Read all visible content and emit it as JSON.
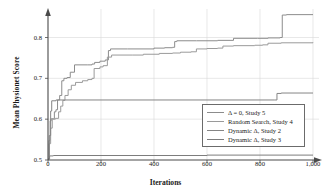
{
  "chart_data": {
    "type": "line",
    "title": "",
    "xlabel": "Iterations",
    "ylabel": "Mean Physionet Score",
    "xlim": [
      0,
      1000
    ],
    "ylim": [
      0.5,
      0.86
    ],
    "grid": true,
    "legend_position": "lower-right",
    "xticks": [
      0,
      200,
      400,
      600,
      800,
      1000
    ],
    "xtick_labels": [
      "0",
      "200",
      "400",
      "600",
      "800",
      "1,000"
    ],
    "yticks": [
      0.5,
      0.6,
      0.7,
      0.8
    ],
    "ytick_labels": [
      "0.5",
      "0.6",
      "0.7",
      "0.8"
    ],
    "series": [
      {
        "name": "Δ = 0, Study 5",
        "color": "#8c8c8c",
        "points": [
          [
            0,
            0.503
          ],
          [
            4,
            0.548
          ],
          [
            8,
            0.596
          ],
          [
            12,
            0.601
          ],
          [
            20,
            0.601
          ],
          [
            24,
            0.618
          ],
          [
            30,
            0.623
          ],
          [
            36,
            0.647
          ],
          [
            44,
            0.658
          ],
          [
            52,
            0.694
          ],
          [
            60,
            0.7
          ],
          [
            72,
            0.702
          ],
          [
            84,
            0.715
          ],
          [
            100,
            0.733
          ],
          [
            150,
            0.733
          ],
          [
            166,
            0.735
          ],
          [
            176,
            0.739
          ],
          [
            196,
            0.742
          ],
          [
            216,
            0.745
          ],
          [
            228,
            0.768
          ],
          [
            236,
            0.772
          ],
          [
            300,
            0.772
          ],
          [
            400,
            0.774
          ],
          [
            440,
            0.775
          ],
          [
            470,
            0.776
          ],
          [
            478,
            0.79
          ],
          [
            486,
            0.792
          ],
          [
            560,
            0.792
          ],
          [
            640,
            0.793
          ],
          [
            700,
            0.798
          ],
          [
            790,
            0.798
          ],
          [
            830,
            0.799
          ],
          [
            876,
            0.8
          ],
          [
            884,
            0.855
          ],
          [
            900,
            0.856
          ],
          [
            1000,
            0.856
          ]
        ]
      },
      {
        "name": "Random Search, Study 4",
        "color": "#9a9a9a",
        "points": [
          [
            0,
            0.503
          ],
          [
            4,
            0.54
          ],
          [
            10,
            0.578
          ],
          [
            16,
            0.6
          ],
          [
            28,
            0.602
          ],
          [
            40,
            0.618
          ],
          [
            48,
            0.632
          ],
          [
            56,
            0.646
          ],
          [
            64,
            0.658
          ],
          [
            76,
            0.672
          ],
          [
            88,
            0.683
          ],
          [
            104,
            0.69
          ],
          [
            130,
            0.694
          ],
          [
            150,
            0.697
          ],
          [
            166,
            0.7
          ],
          [
            174,
            0.724
          ],
          [
            196,
            0.728
          ],
          [
            208,
            0.731
          ],
          [
            224,
            0.752
          ],
          [
            240,
            0.757
          ],
          [
            320,
            0.757
          ],
          [
            360,
            0.759
          ],
          [
            420,
            0.761
          ],
          [
            470,
            0.762
          ],
          [
            500,
            0.764
          ],
          [
            540,
            0.765
          ],
          [
            560,
            0.772
          ],
          [
            600,
            0.773
          ],
          [
            640,
            0.774
          ],
          [
            660,
            0.779
          ],
          [
            700,
            0.78
          ],
          [
            780,
            0.781
          ],
          [
            810,
            0.782
          ],
          [
            830,
            0.786
          ],
          [
            880,
            0.787
          ],
          [
            1000,
            0.788
          ]
        ]
      },
      {
        "name": "Dynamic Δ, Study 2",
        "color": "#858585",
        "points": [
          [
            0,
            0.503
          ],
          [
            5,
            0.56
          ],
          [
            10,
            0.62
          ],
          [
            14,
            0.645
          ],
          [
            30,
            0.647
          ],
          [
            200,
            0.647
          ],
          [
            400,
            0.647
          ],
          [
            600,
            0.647
          ],
          [
            800,
            0.647
          ],
          [
            856,
            0.647
          ],
          [
            864,
            0.663
          ],
          [
            880,
            0.664
          ],
          [
            1000,
            0.664
          ]
        ]
      },
      {
        "name": "Dynamic Δ, Study 3",
        "color": "#7d7d7d",
        "points": [
          [
            0,
            0.502
          ],
          [
            6,
            0.51
          ],
          [
            20,
            0.511
          ],
          [
            200,
            0.511
          ],
          [
            400,
            0.511
          ],
          [
            600,
            0.512
          ],
          [
            800,
            0.512
          ],
          [
            1000,
            0.512
          ]
        ]
      }
    ]
  },
  "axes": {
    "x_axis_name": "iterations-axis",
    "y_axis_name": "score-axis"
  }
}
